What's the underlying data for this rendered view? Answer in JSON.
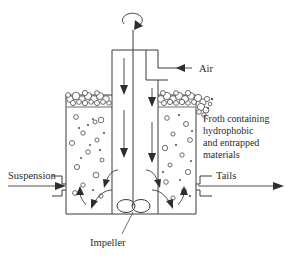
{
  "diagram": {
    "colors": {
      "stroke": "#3a3a3a",
      "bubble_stroke": "#4a4a4a",
      "text": "#2b2b2b",
      "background": "#ffffff"
    }
  },
  "labels": {
    "air": "Air",
    "suspension": "Suspension",
    "tails": "Tails",
    "impeller": "Impeller",
    "froth_line_1": "Froth containing",
    "froth_line_2": "hydrophobic",
    "froth_line_3": "and entrapped",
    "froth_line_4": "materials"
  },
  "icons": {
    "rotation": "rotation-arrow-icon",
    "air_inlet": "air-inlet-arrow-icon",
    "suspension_inlet": "suspension-inlet-arrow-icon",
    "tails_outlet": "tails-outlet-arrow-icon",
    "downflow": "downward-flow-arrow-icon",
    "circulation": "circulation-arrow-icon",
    "impeller": "impeller-icon"
  },
  "components": {
    "tank": "flotation-tank",
    "shaft": "rotating-shaft",
    "downcomer": "air-downcomer-housing",
    "froth_layer": "froth-bubble-layer",
    "liquid": "suspension-liquid-zone"
  }
}
